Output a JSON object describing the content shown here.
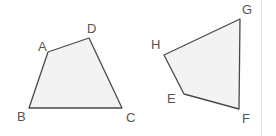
{
  "canvas": {
    "width": 276,
    "height": 136,
    "background": "#ffffff"
  },
  "style": {
    "shape_fill": "#f3f3f3",
    "shape_stroke": "#4a4a4a",
    "stroke_width": 1.3,
    "label_color": "#545454",
    "label_font_size": 13,
    "divider_color": "#e2e2e2"
  },
  "divider": {
    "name": "panel-divider",
    "x": 261
  },
  "figures": [
    {
      "id": "quadrilateral-abdc",
      "name": "quadrilateral-left",
      "points": "48,52 89,38 122,108 29,108",
      "vertices": [
        {
          "label": "A",
          "x": 48,
          "y": 52,
          "label_x": 38,
          "label_y": 40
        },
        {
          "label": "D",
          "x": 89,
          "y": 38,
          "label_x": 87,
          "label_y": 22
        },
        {
          "label": "C",
          "x": 122,
          "y": 108,
          "label_x": 126,
          "label_y": 111
        },
        {
          "label": "B",
          "x": 29,
          "y": 108,
          "label_x": 17,
          "label_y": 110
        }
      ]
    },
    {
      "id": "quadrilateral-hgfe",
      "name": "quadrilateral-right",
      "points": "164,55 240,19 239,109 184,94",
      "vertices": [
        {
          "label": "H",
          "x": 164,
          "y": 55,
          "label_x": 151,
          "label_y": 38
        },
        {
          "label": "G",
          "x": 240,
          "y": 19,
          "label_x": 242,
          "label_y": 3
        },
        {
          "label": "F",
          "x": 239,
          "y": 109,
          "label_x": 242,
          "label_y": 112
        },
        {
          "label": "E",
          "x": 184,
          "y": 94,
          "label_x": 167,
          "label_y": 92
        }
      ]
    }
  ],
  "labels": {
    "a": "A",
    "b": "B",
    "c": "C",
    "d": "D",
    "e": "E",
    "f": "F",
    "g": "G",
    "h": "H"
  }
}
